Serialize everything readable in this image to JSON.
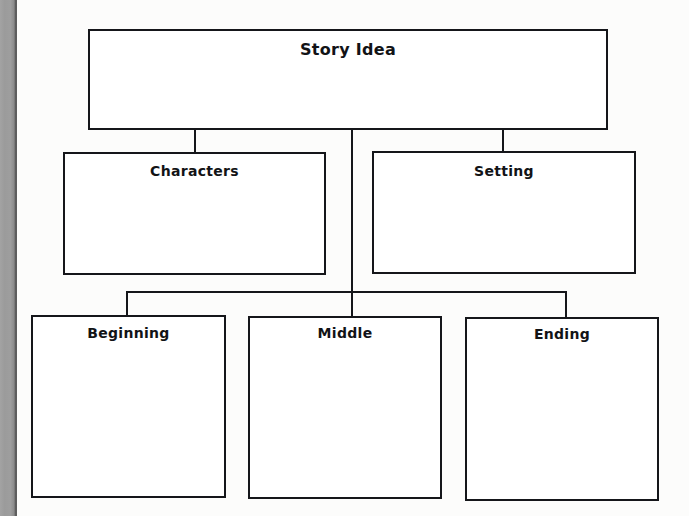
{
  "page": {
    "background_color": "#fbfbfa",
    "ink_color": "#15161a",
    "binding_color": "#9b9b9b"
  },
  "diagram": {
    "type": "hierarchy",
    "root": {
      "id": "story-idea",
      "label": "Story Idea"
    },
    "level_two": [
      {
        "id": "characters",
        "label": "Characters"
      },
      {
        "id": "setting",
        "label": "Setting"
      }
    ],
    "level_three": [
      {
        "id": "beginning",
        "label": "Beginning"
      },
      {
        "id": "middle",
        "label": "Middle"
      },
      {
        "id": "ending",
        "label": "Ending"
      }
    ]
  }
}
